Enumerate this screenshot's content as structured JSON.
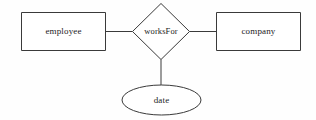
{
  "diagram": {
    "type": "entity-relationship-diagram",
    "background_color": "#fefefe",
    "stroke_color": "#3a3a3a",
    "text_color": "#1c1c1c",
    "entities": [
      {
        "id": "employee",
        "label": "employee",
        "shape": "rectangle",
        "x": 21,
        "y": 12,
        "width": 85,
        "height": 39,
        "center_x": 63.5,
        "center_y": 31.5
      },
      {
        "id": "company",
        "label": "company",
        "shape": "rectangle",
        "x": 216,
        "y": 12,
        "width": 85,
        "height": 39,
        "center_x": 258.5,
        "center_y": 31.5
      }
    ],
    "relationships": [
      {
        "id": "worksFor",
        "label": "worksFor",
        "shape": "diamond",
        "center_x": 161,
        "center_y": 31.5,
        "half_width": 29,
        "half_height": 28.5
      }
    ],
    "attributes": [
      {
        "id": "date",
        "label": "date",
        "shape": "ellipse",
        "center_x": 161.5,
        "center_y": 100,
        "radius_x": 39.5,
        "radius_y": 15
      }
    ],
    "edges": [
      {
        "id": "employee-worksFor",
        "from": "employee",
        "to": "worksFor",
        "x1": 106,
        "y1": 31.5,
        "x2": 132,
        "y2": 31.5
      },
      {
        "id": "worksFor-company",
        "from": "worksFor",
        "to": "company",
        "x1": 190,
        "y1": 31.5,
        "x2": 216,
        "y2": 31.5
      },
      {
        "id": "worksFor-date",
        "from": "worksFor",
        "to": "date",
        "x1": 161,
        "y1": 60,
        "x2": 161,
        "y2": 85
      }
    ]
  }
}
